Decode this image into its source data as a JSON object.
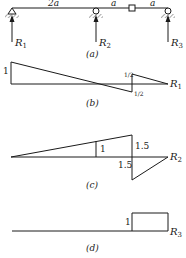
{
  "figure": {
    "a": {
      "caption": "(a)",
      "spans": [
        "2a",
        "a",
        "a"
      ],
      "reactions": [
        {
          "label": "R",
          "sub": "1"
        },
        {
          "label": "R",
          "sub": "2"
        },
        {
          "label": "R",
          "sub": "3"
        }
      ]
    },
    "b": {
      "caption": "(b)",
      "left_value": "1",
      "hinge_upper": "1/2",
      "hinge_lower": "1/2",
      "end_label": {
        "label": "R",
        "sub": "1"
      }
    },
    "c": {
      "caption": "(c)",
      "mid_value": "1",
      "hinge_upper": "1.5",
      "hinge_lower": "1.5",
      "end_label": {
        "label": "R",
        "sub": "2"
      }
    },
    "d": {
      "caption": "(d)",
      "value": "1",
      "end_label": {
        "label": "R",
        "sub": "3"
      }
    }
  }
}
